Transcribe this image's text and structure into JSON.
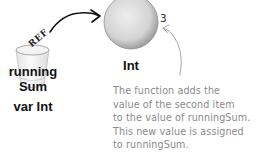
{
  "diagram": {
    "variable": {
      "name_line1": "running",
      "name_line2": "Sum",
      "type_label": "var Int",
      "ref_label": "REF"
    },
    "object": {
      "type_label": "Int",
      "value": "3"
    },
    "annotation": {
      "lines": [
        "The function adds the",
        "value of the second item",
        "to the value of runningSum.",
        "This new value is assigned",
        "to runningSum."
      ]
    },
    "colors": {
      "text": "#111111",
      "annotation": "#8a8a8a",
      "object_fill": "#d9d9d9",
      "object_edge": "#8f8f8f"
    }
  }
}
